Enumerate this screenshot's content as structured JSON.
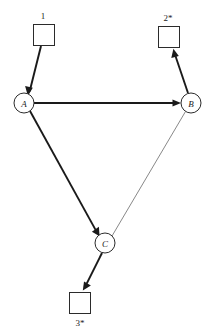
{
  "diagram": {
    "type": "directed-graph",
    "background_color": "#ffffff",
    "stroke_color": "#1a1a1a",
    "thin_edge_color": "#6a6a6a",
    "width": 207,
    "height": 336,
    "nodes": [
      {
        "id": "A",
        "label": "A",
        "shape": "circle",
        "cx": 24,
        "cy": 103,
        "r": 10
      },
      {
        "id": "B",
        "label": "B",
        "shape": "circle",
        "cx": 191,
        "cy": 103,
        "r": 10
      },
      {
        "id": "C",
        "label": "C",
        "shape": "circle",
        "cx": 105,
        "cy": 243,
        "r": 10
      }
    ],
    "terminals": [
      {
        "id": "t1",
        "label": "1",
        "shape": "square",
        "x": 33,
        "y": 24,
        "size": 21,
        "label_position": "above",
        "label_x": 43,
        "label_y": 19
      },
      {
        "id": "t2",
        "label": "2*",
        "shape": "square",
        "x": 158,
        "y": 26,
        "size": 21,
        "label_position": "above",
        "label_x": 168,
        "label_y": 21
      },
      {
        "id": "t3",
        "label": "3*",
        "shape": "square",
        "x": 69,
        "y": 292,
        "size": 21,
        "label_position": "below",
        "label_x": 80,
        "label_y": 326
      }
    ],
    "edges": [
      {
        "id": "e1",
        "from": "t1",
        "to": "A",
        "weight": "thick",
        "arrowhead": true,
        "x1": 41,
        "y1": 46,
        "x2": 28,
        "y2": 94
      },
      {
        "id": "e2",
        "from": "A",
        "to": "B",
        "weight": "thick",
        "arrowhead": true,
        "x1": 34,
        "y1": 103,
        "x2": 180,
        "y2": 103
      },
      {
        "id": "e3",
        "from": "A",
        "to": "C",
        "weight": "thick",
        "arrowhead": true,
        "x1": 30,
        "y1": 111,
        "x2": 99,
        "y2": 236
      },
      {
        "id": "e4",
        "from": "C",
        "to": "B",
        "weight": "thin",
        "arrowhead": false,
        "x1": 112,
        "y1": 236,
        "x2": 185,
        "y2": 112
      },
      {
        "id": "e5",
        "from": "B",
        "to": "t2",
        "weight": "thick",
        "arrowhead": true,
        "x1": 188,
        "y1": 93,
        "x2": 173,
        "y2": 49
      },
      {
        "id": "e6",
        "from": "C",
        "to": "t3",
        "weight": "thick",
        "arrowhead": true,
        "x1": 102,
        "y1": 253,
        "x2": 83,
        "y2": 290
      }
    ]
  }
}
